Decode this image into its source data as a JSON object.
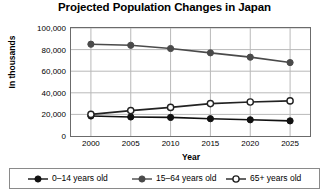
{
  "chart_data": {
    "type": "line",
    "title": "Projected Population Changes in Japan",
    "xlabel": "Year",
    "ylabel": "In thousands",
    "categories": [
      2000,
      2005,
      2010,
      2015,
      2020,
      2025
    ],
    "x_tick_labels": [
      "2000",
      "2005",
      "2010",
      "2015",
      "2020",
      "2025"
    ],
    "y_tick_labels": [
      "0",
      "20,000",
      "40,000",
      "60,000",
      "80,000",
      "100,000"
    ],
    "y_tick_values": [
      0,
      20000,
      40000,
      60000,
      80000,
      100000
    ],
    "ylim": [
      0,
      100000
    ],
    "grid": "horizontal-and-vertical",
    "legend_position": "bottom",
    "series": [
      {
        "name": "0–14 years old",
        "marker": "filled-circle",
        "color": "#111111",
        "values": [
          18500,
          17600,
          17200,
          16000,
          15000,
          14000
        ]
      },
      {
        "name": "15–64 years old",
        "marker": "gray-filled-circle",
        "color": "#4a4a4a",
        "values": [
          85000,
          84000,
          81000,
          77000,
          73000,
          68000
        ]
      },
      {
        "name": "65+ years old",
        "marker": "open-circle",
        "color": "#222222",
        "values": [
          20000,
          23500,
          26500,
          30000,
          31500,
          32500
        ]
      }
    ]
  },
  "legend": {
    "items": [
      {
        "label": "0–14 years old"
      },
      {
        "label": "15–64 years old"
      },
      {
        "label": "65+ years old"
      }
    ]
  }
}
